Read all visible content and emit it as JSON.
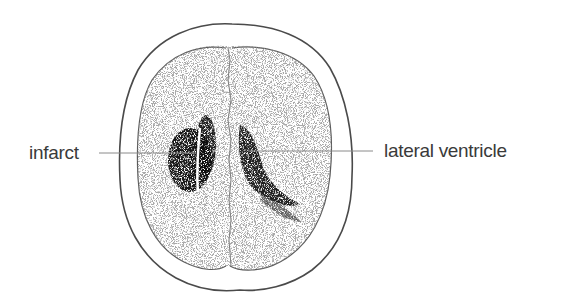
{
  "figure": {
    "labels": [
      {
        "id": "infarct",
        "text": "infarct"
      },
      {
        "id": "lateral-ventricle",
        "text": "lateral ventricle"
      }
    ]
  },
  "colors": {
    "outline": "#4a4a4a",
    "leader_line": "#8a8a8a",
    "stipple_dark": "#1a1a1a",
    "stipple_light": "#9a9a9a",
    "text": "#3a3a3a"
  }
}
